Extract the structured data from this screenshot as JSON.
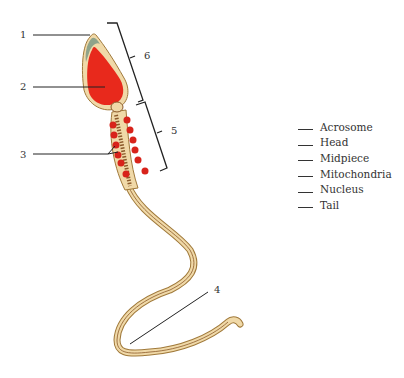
{
  "diagram": {
    "callouts": [
      {
        "number": "1",
        "target": "tip of head"
      },
      {
        "number": "2",
        "target": "center of head"
      },
      {
        "number": "3",
        "target": "spiral bodies along midpiece"
      },
      {
        "number": "4",
        "target": "long flagellum"
      },
      {
        "number": "5",
        "target": "bracket spanning midpiece"
      },
      {
        "number": "6",
        "target": "bracket spanning head"
      }
    ],
    "colors": {
      "nucleus": "#e8291c",
      "cytoplasm": "#f0d9a8",
      "acrosome_cap": "#8fa38a",
      "outline": "#a0793a",
      "mitochondria": "#d8231b",
      "tail_stripe": "#8b5a2b",
      "label_line": "#222222"
    }
  },
  "legend": {
    "items": [
      {
        "label": "Acrosome"
      },
      {
        "label": "Head"
      },
      {
        "label": "Midpiece"
      },
      {
        "label": "Mitochondria"
      },
      {
        "label": "Nucleus"
      },
      {
        "label": "Tail"
      }
    ]
  }
}
